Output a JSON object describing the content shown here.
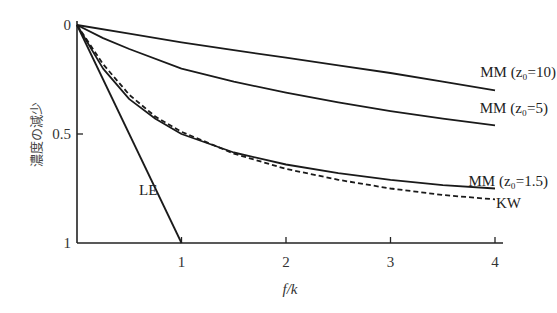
{
  "chart_data": {
    "type": "line",
    "title": "",
    "xlabel": "f/k",
    "ylabel": "濃度の減少",
    "xlim": [
      0,
      4
    ],
    "ylim": [
      0,
      1
    ],
    "y_inverted": true,
    "grid": false,
    "xticks": [
      1,
      2,
      3,
      4
    ],
    "xtick_labels": [
      "1",
      "2",
      "3",
      "4"
    ],
    "yticks": [
      0,
      0.5,
      1
    ],
    "ytick_labels": [
      "0",
      "0.5",
      "1"
    ],
    "series": [
      {
        "name": "MM (z0=10)",
        "label": "MM (z₀=10)",
        "style": "solid",
        "x": [
          0,
          0.5,
          1,
          1.5,
          2,
          2.5,
          3,
          3.5,
          4
        ],
        "y": [
          0,
          0.04,
          0.08,
          0.115,
          0.15,
          0.185,
          0.22,
          0.26,
          0.3
        ]
      },
      {
        "name": "MM (z0=5)",
        "label": "MM (z₀=5)",
        "style": "solid",
        "x": [
          0,
          0.25,
          0.5,
          1,
          1.5,
          2,
          2.5,
          3,
          3.5,
          4
        ],
        "y": [
          0,
          0.06,
          0.11,
          0.2,
          0.26,
          0.31,
          0.355,
          0.395,
          0.43,
          0.46
        ]
      },
      {
        "name": "MM (z0=1.5)",
        "label": "MM (z₀=1.5)",
        "style": "solid",
        "x": [
          0,
          0.25,
          0.5,
          0.75,
          1,
          1.5,
          2,
          2.5,
          3,
          3.5,
          4
        ],
        "y": [
          0,
          0.2,
          0.34,
          0.43,
          0.5,
          0.585,
          0.64,
          0.68,
          0.71,
          0.735,
          0.75
        ]
      },
      {
        "name": "KW",
        "label": "KW",
        "style": "dashed",
        "x": [
          0,
          0.25,
          0.5,
          0.75,
          1,
          1.5,
          2,
          2.5,
          3,
          3.5,
          4
        ],
        "y": [
          0,
          0.18,
          0.32,
          0.42,
          0.49,
          0.59,
          0.66,
          0.71,
          0.75,
          0.78,
          0.8
        ]
      },
      {
        "name": "LE",
        "label": "LE",
        "style": "solid",
        "x": [
          0,
          1
        ],
        "y": [
          0,
          1
        ]
      }
    ]
  }
}
